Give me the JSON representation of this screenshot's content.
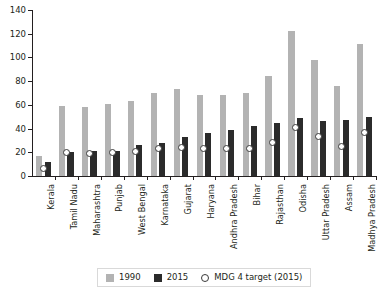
{
  "chart_data": {
    "type": "bar",
    "title": "",
    "subtitle": "",
    "xlabel": "",
    "ylabel": "",
    "ylim": [
      0,
      140
    ],
    "yticks": [
      0,
      20,
      40,
      60,
      80,
      100,
      120,
      140
    ],
    "grid": false,
    "legend_position": "bottom",
    "categories": [
      "Kerala",
      "Tamil Nadu",
      "Maharashtra",
      "Punjab",
      "West Bengal",
      "Karnataka",
      "Gujarat",
      "Haryana",
      "Andhra Pradesh",
      "Bihar",
      "Rajasthan",
      "Odisha",
      "Uttar Pradesh",
      "Assam",
      "Madhya Pradesh"
    ],
    "series": [
      {
        "name": "1990",
        "color": "#b3b3b3",
        "type": "bar",
        "values": [
          17,
          59,
          58,
          61,
          63,
          70,
          73,
          68,
          68,
          70,
          84,
          122,
          98,
          76,
          111
        ]
      },
      {
        "name": "2015",
        "color": "#2b2b2b",
        "type": "bar",
        "values": [
          12,
          20,
          21,
          21,
          26,
          28,
          33,
          36,
          39,
          42,
          45,
          49,
          46,
          47,
          50
        ]
      },
      {
        "name": "MDG 4 target (2015)",
        "color": "#ffffff",
        "type": "marker",
        "marker": "open-circle",
        "values": [
          6,
          20,
          19,
          20,
          21,
          23,
          24,
          23,
          23,
          23,
          28,
          41,
          33,
          25,
          37
        ]
      }
    ]
  },
  "legend": {
    "items": [
      {
        "label": "1990",
        "swatch": "square-light-gray"
      },
      {
        "label": "2015",
        "swatch": "square-dark"
      },
      {
        "label": "MDG 4 target (2015)",
        "swatch": "open-circle"
      }
    ]
  }
}
